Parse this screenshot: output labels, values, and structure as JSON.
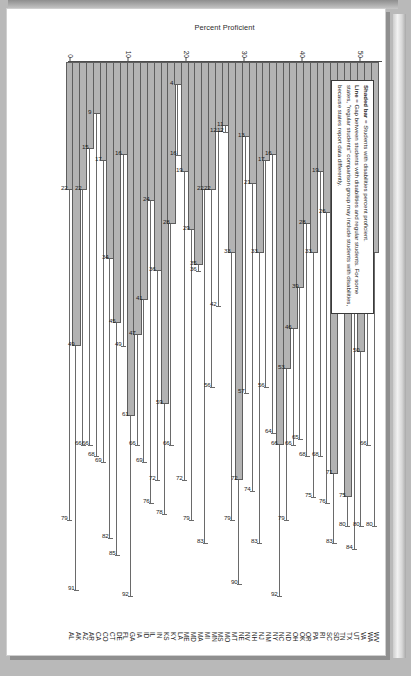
{
  "figure": {
    "axis_title": "Percent Proficient",
    "legend": {
      "line1_key": "Shaded bar",
      "line1_text": " = Students with disabilities percent proficient.",
      "line2_key": "Line",
      "line2_text": " = Gap between students with disabilities and regular students. For some states, \"regular students\" comparison group may include students with disabilities, because states report data differently."
    }
  },
  "chart_data": {
    "type": "bar",
    "title": "",
    "xlabel": "",
    "ylabel": "Percent Proficient",
    "ylim": [
      0,
      100
    ],
    "yticks": [
      0,
      10,
      20,
      30,
      40,
      50,
      60,
      70,
      80,
      90,
      100
    ],
    "grid": false,
    "orientation": "horizontal-rotated",
    "legend_position": "upper-left",
    "categories": [
      "AL",
      "AK",
      "AZ",
      "AR",
      "CA",
      "CO",
      "CT",
      "DE",
      "FL",
      "GA",
      "IA",
      "ID",
      "IL",
      "IN",
      "KS",
      "KY",
      "LA",
      "ME",
      "MD",
      "MA",
      "MI",
      "MN",
      "MS",
      "MO",
      "MT",
      "NE",
      "NV",
      "NH",
      "NJ",
      "NM",
      "NY",
      "NC",
      "ND",
      "OH",
      "OK",
      "OR",
      "PA",
      "RI",
      "SC",
      "SD",
      "TN",
      "TX",
      "UT",
      "VA",
      "WA",
      "WV"
    ],
    "series": [
      {
        "name": "Shaded bar = Students with disabilities percent proficient",
        "values": [
          22,
          49,
          22,
          15,
          9,
          17,
          34,
          45,
          16,
          61,
          47,
          41,
          24,
          36,
          59,
          28,
          4,
          19,
          29,
          35,
          22,
          22,
          12,
          11,
          33,
          72,
          13,
          21,
          33,
          17,
          16,
          66,
          53,
          46,
          39,
          28,
          33,
          19,
          26,
          71,
          15,
          75,
          22,
          50,
          22,
          33
        ]
      },
      {
        "name": "Line = Gap endpoint (regular students percent proficient)",
        "values": [
          79,
          91,
          66,
          66,
          68,
          69,
          82,
          85,
          49,
          92,
          66,
          69,
          76,
          72,
          78,
          66,
          16,
          72,
          79,
          36,
          83,
          56,
          42,
          12,
          79,
          90,
          57,
          74,
          83,
          56,
          64,
          92,
          79,
          66,
          65,
          68,
          75,
          68,
          76,
          83,
          40,
          80,
          84,
          80,
          66,
          80
        ]
      }
    ]
  }
}
